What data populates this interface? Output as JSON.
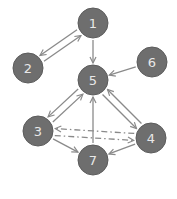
{
  "diagram": {
    "type": "directed-graph",
    "colors": {
      "node_fill": "#6e6e6e",
      "node_stroke": "#5c5c5c",
      "label": "#e8e8e8",
      "edge": "#8a8a8a"
    },
    "nodes": [
      {
        "id": "1",
        "label": "1",
        "x": 93,
        "y": 23
      },
      {
        "id": "2",
        "label": "2",
        "x": 28,
        "y": 68
      },
      {
        "id": "5",
        "label": "5",
        "x": 93,
        "y": 80
      },
      {
        "id": "6",
        "label": "6",
        "x": 152,
        "y": 62
      },
      {
        "id": "3",
        "label": "3",
        "x": 38,
        "y": 131
      },
      {
        "id": "4",
        "label": "4",
        "x": 151,
        "y": 138
      },
      {
        "id": "7",
        "label": "7",
        "x": 93,
        "y": 160
      }
    ],
    "edges": [
      {
        "from": "1",
        "to": "2",
        "style": "solid"
      },
      {
        "from": "2",
        "to": "1",
        "style": "solid"
      },
      {
        "from": "1",
        "to": "5",
        "style": "solid"
      },
      {
        "from": "6",
        "to": "5",
        "style": "solid"
      },
      {
        "from": "5",
        "to": "3",
        "style": "solid"
      },
      {
        "from": "3",
        "to": "5",
        "style": "solid"
      },
      {
        "from": "5",
        "to": "4",
        "style": "solid"
      },
      {
        "from": "4",
        "to": "5",
        "style": "solid"
      },
      {
        "from": "3",
        "to": "4",
        "style": "dash-dot"
      },
      {
        "from": "4",
        "to": "3",
        "style": "dash-dot"
      },
      {
        "from": "3",
        "to": "7",
        "style": "solid"
      },
      {
        "from": "4",
        "to": "7",
        "style": "solid"
      },
      {
        "from": "7",
        "to": "5",
        "style": "solid"
      }
    ]
  }
}
